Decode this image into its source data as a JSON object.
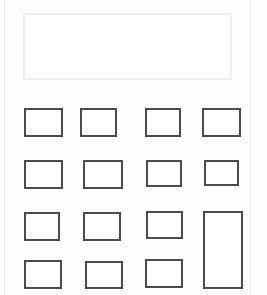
{
  "app": {
    "name": "calculator",
    "title": "Calculator",
    "background_color": "#fdfdfd",
    "panel_edge_color": "#ececec"
  },
  "display": {
    "name": "calculator-display",
    "value": "",
    "placeholder": "",
    "border_color": "#efefef",
    "background_color": "#ffffff",
    "text_color": "#2a2a2a"
  },
  "keypad": {
    "border_color": "#4c4c4c",
    "key_background_color": "#ffffff",
    "rows": 4,
    "columns": 4,
    "keys": [
      {
        "name": "key-r1c1",
        "label": "",
        "left": 19,
        "top": 108,
        "width": 39,
        "height": 29,
        "row": 1,
        "col": 1,
        "span": 1
      },
      {
        "name": "key-r1c2",
        "label": "",
        "left": 75,
        "top": 108,
        "width": 37,
        "height": 29,
        "row": 1,
        "col": 2,
        "span": 1
      },
      {
        "name": "key-r1c3",
        "label": "",
        "left": 140,
        "top": 108,
        "width": 36,
        "height": 29,
        "row": 1,
        "col": 3,
        "span": 1
      },
      {
        "name": "key-r1c4",
        "label": "",
        "left": 197,
        "top": 108,
        "width": 39,
        "height": 29,
        "row": 1,
        "col": 4,
        "span": 1
      },
      {
        "name": "key-r2c1",
        "label": "",
        "left": 19,
        "top": 160,
        "width": 39,
        "height": 29,
        "row": 2,
        "col": 1,
        "span": 1
      },
      {
        "name": "key-r2c2",
        "label": "",
        "left": 78,
        "top": 160,
        "width": 40,
        "height": 29,
        "row": 2,
        "col": 2,
        "span": 1
      },
      {
        "name": "key-r2c3",
        "label": "",
        "left": 141,
        "top": 160,
        "width": 36,
        "height": 27,
        "row": 2,
        "col": 3,
        "span": 1
      },
      {
        "name": "key-r2c4",
        "label": "",
        "left": 199,
        "top": 160,
        "width": 35,
        "height": 26,
        "row": 2,
        "col": 4,
        "span": 1
      },
      {
        "name": "key-r3c1",
        "label": "",
        "left": 19,
        "top": 212,
        "width": 36,
        "height": 29,
        "row": 3,
        "col": 1,
        "span": 1
      },
      {
        "name": "key-r3c2",
        "label": "",
        "left": 78,
        "top": 212,
        "width": 38,
        "height": 29,
        "row": 3,
        "col": 2,
        "span": 1
      },
      {
        "name": "key-r3c3",
        "label": "",
        "left": 141,
        "top": 211,
        "width": 37,
        "height": 28,
        "row": 3,
        "col": 3,
        "span": 1
      },
      {
        "name": "key-equals",
        "label": "",
        "left": 198,
        "top": 211,
        "width": 40,
        "height": 78,
        "row": 3,
        "col": 4,
        "span": 2
      },
      {
        "name": "key-r4c1",
        "label": "",
        "left": 19,
        "top": 260,
        "width": 38,
        "height": 29,
        "row": 4,
        "col": 1,
        "span": 1
      },
      {
        "name": "key-r4c2",
        "label": "",
        "left": 80,
        "top": 261,
        "width": 38,
        "height": 28,
        "row": 4,
        "col": 2,
        "span": 1
      },
      {
        "name": "key-r4c3",
        "label": "",
        "left": 140,
        "top": 259,
        "width": 38,
        "height": 29,
        "row": 4,
        "col": 3,
        "span": 1
      }
    ]
  }
}
